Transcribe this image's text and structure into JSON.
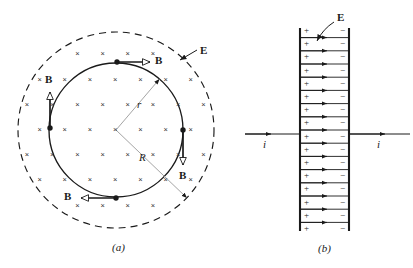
{
  "figure": {
    "panels": [
      {
        "id": "a",
        "caption": "(a)"
      },
      {
        "id": "b",
        "caption": "(b)"
      }
    ]
  },
  "panel_a": {
    "caption": "(a)",
    "center": {
      "x": 116,
      "y": 130
    },
    "inner_circle": {
      "radius": 67,
      "style": "solid",
      "label": "r"
    },
    "outer_circle": {
      "radius": 98,
      "style": "dashed",
      "label": "R"
    },
    "radius_labels": {
      "inner": "r",
      "outer": "R"
    },
    "field_label": "E",
    "field_symbol": "×",
    "field_symbol_name": "into-page-cross",
    "b_vectors": [
      {
        "position": "top",
        "label": "B",
        "direction": "right"
      },
      {
        "position": "right",
        "label": "B",
        "direction": "down"
      },
      {
        "position": "bottom",
        "label": "B",
        "direction": "left"
      },
      {
        "position": "left",
        "label": "B",
        "direction": "up"
      }
    ]
  },
  "panel_b": {
    "caption": "(b)",
    "field_label": "E",
    "left_plate_sign": "+",
    "right_plate_sign": "−",
    "current_label_left": "i",
    "current_label_right": "i",
    "plate_charge_count": 16,
    "field_line_count": 15
  },
  "colors": {
    "ink": "#1a1a1a",
    "line": "#333333",
    "leader": "#8a8a8a",
    "background": "#ffffff"
  }
}
